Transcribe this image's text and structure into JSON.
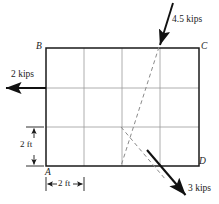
{
  "figure": {
    "type": "structural-loading-diagram",
    "colors": {
      "outline": "#1a1a1a",
      "grid": "#9a9a9a",
      "dashed": "#8a8a8a",
      "arrow": "#111111",
      "dimension": "#1a1a1a",
      "background": "#ffffff"
    },
    "plate": {
      "x": 46,
      "y": 48,
      "width": 153,
      "height": 118,
      "grid_columns": 4,
      "grid_rows": 3,
      "grid_x": [
        84,
        122,
        160
      ],
      "grid_y": [
        88,
        127
      ]
    },
    "corners": [
      {
        "name": "corner-label-b",
        "label": "B",
        "x": 36,
        "y": 42
      },
      {
        "name": "corner-label-c",
        "label": "C",
        "x": 201,
        "y": 42
      },
      {
        "name": "corner-label-a",
        "label": "A",
        "x": 45,
        "y": 168
      },
      {
        "name": "corner-label-d",
        "label": "D",
        "x": 199,
        "y": 157
      }
    ],
    "forces": [
      {
        "name": "force-2-kips",
        "label": "2 kips",
        "magnitude": 2,
        "unit": "kips",
        "direction": "left",
        "tail": {
          "x": 46,
          "y": 88
        },
        "head": {
          "x": 4,
          "y": 88
        },
        "label_pos": {
          "x": 11,
          "y": 70
        }
      },
      {
        "name": "force-4p5-kips",
        "label": "4.5 kips",
        "magnitude": 4.5,
        "unit": "kips",
        "direction": "down-left",
        "tail": {
          "x": 173,
          "y": 3
        },
        "head": {
          "x": 159,
          "y": 47
        },
        "label_pos": {
          "x": 172,
          "y": 15
        }
      },
      {
        "name": "force-3-kips",
        "label": "3 kips",
        "magnitude": 3,
        "unit": "kips",
        "direction": "down-right",
        "tail": {
          "x": 147,
          "y": 150
        },
        "head": {
          "x": 187,
          "y": 197
        },
        "label_pos": {
          "x": 188,
          "y": 184
        }
      }
    ],
    "action_lines": [
      {
        "name": "action-line-4p5-kips",
        "from": {
          "x": 159,
          "y": 47
        },
        "to": {
          "x": 121,
          "y": 166
        }
      },
      {
        "name": "action-line-3-kips",
        "from": {
          "x": 121,
          "y": 127
        },
        "to": {
          "x": 166,
          "y": 180
        }
      }
    ],
    "dimensions": [
      {
        "name": "dimension-vertical-2ft",
        "label": "2 ft",
        "value": 2,
        "unit": "ft",
        "orientation": "vertical",
        "axis_x": 34,
        "from": 127,
        "to": 166,
        "label_pos": {
          "x": 20,
          "y": 140
        }
      },
      {
        "name": "dimension-horizontal-2ft",
        "label": "2 ft",
        "value": 2,
        "unit": "ft",
        "orientation": "horizontal",
        "axis_y": 184,
        "from": 46,
        "to": 84,
        "label_pos": {
          "x": 55,
          "y": 179
        }
      }
    ]
  }
}
